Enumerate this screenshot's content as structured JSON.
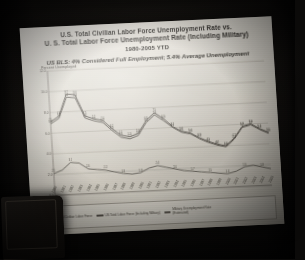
{
  "scene": {
    "description": "photograph-of-projected-slide",
    "room_color": "#141210",
    "slide_color": "#eae7df"
  },
  "slide": {
    "title_line_1": "U.S. Total Civilian Labor Force Unemployment Rate vs.",
    "title_line_2": "U. S. Total Labor Force Unemployment Rate (Including Military)",
    "title_line_3": "1980-2005 YTD",
    "subtitle": "US BLS: 4% Considered Full Employment; 5.4% Average Unemployment"
  },
  "chart_data": {
    "type": "line",
    "title": "U.S. Total Civilian Labor Force Unemployment Rate vs. U. S. Total Labor Force Unemployment Rate (Including Military) 1980-2005 YTD",
    "subtitle": "US BLS: 4% Considered Full Employment; 5.4% Average Unemployment",
    "xlabel": "",
    "ylabel": "Percent Unemployed",
    "ylim": [
      0,
      12
    ],
    "yticks": [
      0,
      2,
      4,
      6,
      8,
      10,
      12
    ],
    "ytick_labels": [
      "0.0",
      "2.0",
      "4.0",
      "6.0",
      "8.0",
      "10.0",
      "12.0"
    ],
    "grid": true,
    "legend_position": "bottom",
    "categories": [
      "1980",
      "1981",
      "1982",
      "1983",
      "1984",
      "1985",
      "1986",
      "1987",
      "1988",
      "1989",
      "1990",
      "1991",
      "1992",
      "1993",
      "1994",
      "1995",
      "1996",
      "1997",
      "1998",
      "1999",
      "2000",
      "2001",
      "2002",
      "2003",
      "2004",
      "2005"
    ],
    "series": [
      {
        "name": "US Total Civilian Labor Force",
        "color": "#4e4a43",
        "values": [
          7.1,
          7.6,
          9.7,
          9.6,
          7.5,
          7.2,
          7.0,
          6.2,
          5.5,
          5.3,
          5.6,
          6.8,
          7.5,
          6.9,
          6.1,
          5.6,
          5.4,
          4.9,
          4.5,
          4.2,
          4.0,
          4.7,
          5.8,
          6.0,
          5.5,
          5.1
        ]
      },
      {
        "name": "US Total Labor Force (Including Military)",
        "color": "#55514a",
        "values": [
          6.9,
          7.4,
          9.4,
          9.3,
          7.3,
          7.0,
          6.8,
          6.0,
          5.3,
          5.1,
          5.4,
          6.6,
          7.3,
          6.7,
          6.0,
          5.5,
          5.3,
          4.8,
          4.4,
          4.1,
          3.9,
          4.6,
          5.7,
          5.9,
          5.4,
          5.0
        ]
      },
      {
        "name": "Military Unemployment Rate (Estimated)",
        "color": "#5a564e",
        "values": [
          2.1,
          2.4,
          3.1,
          3.0,
          2.4,
          2.3,
          2.2,
          2.0,
          1.8,
          1.7,
          1.8,
          2.2,
          2.4,
          2.2,
          2.0,
          1.8,
          1.7,
          1.6,
          1.5,
          1.4,
          1.3,
          1.5,
          1.9,
          2.0,
          1.8,
          1.6
        ]
      }
    ],
    "legend": [
      "US Total Civilian Labor Force",
      "US Total Labor Force (Including Military)",
      "Military Unemployment Rate (Estimated)"
    ]
  }
}
